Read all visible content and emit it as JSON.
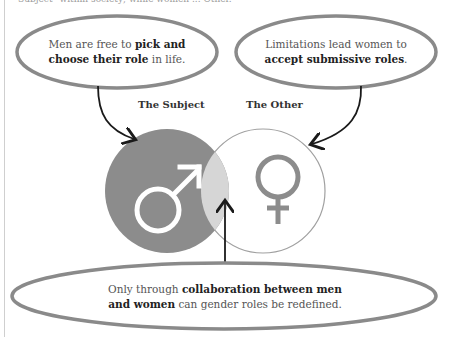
{
  "header": {
    "truncated_text": "Subject\" within society; while women ... Other."
  },
  "bubbles": {
    "top_left": {
      "pre": "Men are free to ",
      "bold1": "pick and",
      "bold2": "choose their role",
      "post": " in life."
    },
    "top_right": {
      "line1": "Limitations lead women to",
      "bold": "accept submissive roles",
      "post": "."
    },
    "bottom": {
      "pre": "Only through ",
      "bold1": "collaboration between men",
      "bold2": "and women",
      "post": " can gender roles be redefined."
    }
  },
  "venn": {
    "left_label": "The Subject",
    "right_label": "The Other",
    "left_symbol": "male-symbol",
    "right_symbol": "female-symbol",
    "colors": {
      "left_fill": "#8c8c8c",
      "overlap_fill": "#d6d6d6",
      "right_fill": "#ffffff",
      "right_stroke": "#a0a0a0",
      "symbol_female": "#8c8c8c",
      "symbol_male": "#ffffff",
      "bubble_stroke": "#8a8a8a",
      "arrow": "#1a1a1a"
    }
  }
}
